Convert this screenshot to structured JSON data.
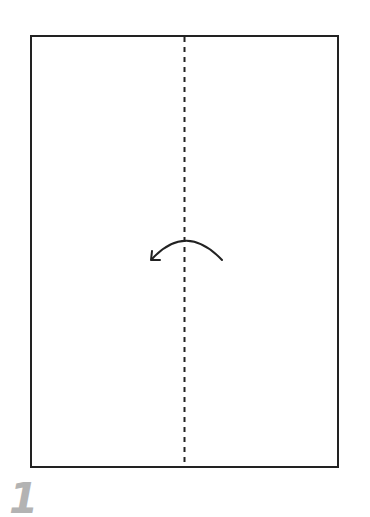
{
  "diagram": {
    "type": "folding-instruction",
    "step": {
      "number": "1",
      "color": "#b3b3b3"
    },
    "paper": {
      "x": 31,
      "y": 36,
      "width": 307,
      "height": 431,
      "stroke": "#222222",
      "fill": "#ffffff"
    },
    "fold_line": {
      "style": "dashed",
      "orientation": "vertical",
      "x": 184,
      "label": "valley-fold-line"
    },
    "arrow": {
      "direction": "right-to-left",
      "meaning": "fold right half over to left",
      "icon": "curved-arrow-left-icon"
    }
  }
}
